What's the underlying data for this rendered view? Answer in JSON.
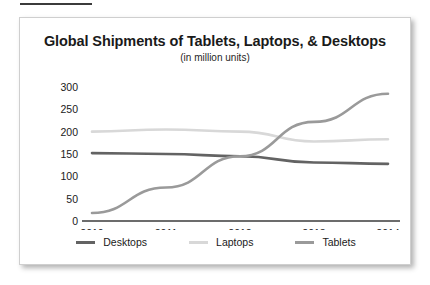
{
  "top_rule": {
    "color": "#3b3b3b"
  },
  "panel": {
    "border_color": "#cfcfcf",
    "background": "#ffffff"
  },
  "chart_data": {
    "type": "line",
    "title": "Global Shipments of Tablets, Laptops, & Desktops",
    "subtitle": "(in million units)",
    "xlabel": "",
    "ylabel": "",
    "categories": [
      "2010",
      "2011",
      "2012",
      "2013",
      "2014"
    ],
    "x": [
      2010,
      2011,
      2012,
      2013,
      2014
    ],
    "ylim": [
      0,
      300
    ],
    "yticks": [
      0,
      50,
      100,
      150,
      200,
      250,
      300
    ],
    "ytick_labels": [
      "0",
      "50",
      "100",
      "150",
      "200",
      "250",
      "300"
    ],
    "grid": false,
    "legend_position": "bottom",
    "series": [
      {
        "name": "Desktops",
        "color": "#636363",
        "values": [
          152,
          150,
          145,
          131,
          128
        ]
      },
      {
        "name": "Laptops",
        "color": "#d8d8d8",
        "values": [
          200,
          205,
          200,
          178,
          183
        ]
      },
      {
        "name": "Tablets",
        "color": "#9a9a9a",
        "values": [
          18,
          75,
          145,
          222,
          285
        ]
      }
    ]
  }
}
